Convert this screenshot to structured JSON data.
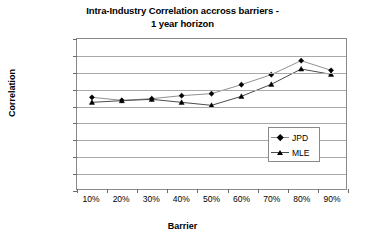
{
  "chart_data": {
    "type": "line",
    "title": "Intra-Industry Correlation accross barriers - 1 year horizon",
    "title_lines": [
      "Intra-Industry Correlation accross barriers -",
      "1 year horizon"
    ],
    "xlabel": "Barrier",
    "ylabel": "Correlation",
    "categories": [
      "10%",
      "20%",
      "30%",
      "40%",
      "50%",
      "60%",
      "70%",
      "80%",
      "90%"
    ],
    "x_values": [
      10,
      20,
      30,
      40,
      50,
      60,
      70,
      80,
      90
    ],
    "y_tick_labels": [
      "0.0%",
      "5.0%",
      "10.0%",
      "15.0%",
      "20.0%",
      "25.0%",
      "30.0%",
      "35.0%",
      "40.0%",
      "45.0%"
    ],
    "y_tick_values": [
      0,
      5,
      10,
      15,
      20,
      25,
      30,
      35,
      40,
      45
    ],
    "ylim": [
      0,
      45
    ],
    "grid": true,
    "legend_position": "inside-bottom-right",
    "series": [
      {
        "name": "JPD",
        "marker": "diamond",
        "color": "#000000",
        "line_color": "#8f8f8f",
        "values": [
          27.5,
          26.6,
          27.1,
          28.0,
          28.6,
          31.3,
          34.3,
          38.5,
          35.6
        ]
      },
      {
        "name": "MLE",
        "marker": "triangle",
        "color": "#000000",
        "line_color": "#4a4a4a",
        "values": [
          26.0,
          26.5,
          26.9,
          26.0,
          25.1,
          27.8,
          31.4,
          36.0,
          34.4
        ]
      }
    ]
  },
  "legend": {
    "items": [
      {
        "label": "JPD"
      },
      {
        "label": "MLE"
      }
    ]
  },
  "colors": {
    "plot_border": "#8a8a8a",
    "gridline": "#a8a8a8",
    "text": "#000000",
    "background": "#ffffff"
  }
}
